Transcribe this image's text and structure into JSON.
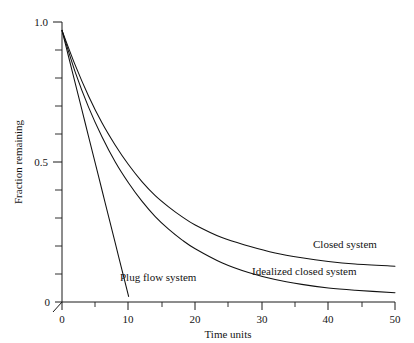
{
  "chart_data": {
    "type": "line",
    "title": "",
    "xlabel": "Time units",
    "ylabel": "Fraction remaining",
    "xlim": [
      0,
      50
    ],
    "ylim": [
      0,
      1.0
    ],
    "grid": false,
    "legend_position": "inline-right",
    "x_ticks_major": [
      0,
      10,
      20,
      30,
      40,
      50
    ],
    "x_tick_labels": [
      "0",
      "10",
      "20",
      "30",
      "40",
      "50"
    ],
    "x_ticks_minor": [
      5,
      15,
      25,
      35,
      45
    ],
    "y_ticks_major": [
      0,
      0.5,
      1.0
    ],
    "y_tick_labels": [
      "0",
      "0.5",
      "1.0"
    ],
    "y_ticks_minor": [
      0.1,
      0.2,
      0.3,
      0.4,
      0.6,
      0.7,
      0.8,
      0.9
    ],
    "series": [
      {
        "name": "Plug flow system",
        "label": "Plug flow system",
        "x": [
          0,
          1,
          2,
          3,
          4,
          5,
          6,
          7,
          8,
          9,
          10
        ],
        "values": [
          0.97,
          0.875,
          0.78,
          0.685,
          0.59,
          0.495,
          0.4,
          0.305,
          0.21,
          0.115,
          0.02
        ]
      },
      {
        "name": "Closed system",
        "label": "Closed system",
        "x": [
          0,
          2,
          4,
          6,
          8,
          10,
          12,
          14,
          16,
          18,
          20,
          24,
          28,
          32,
          36,
          40,
          44,
          50
        ],
        "values": [
          0.97,
          0.845,
          0.735,
          0.64,
          0.56,
          0.49,
          0.43,
          0.38,
          0.34,
          0.305,
          0.275,
          0.23,
          0.2,
          0.175,
          0.158,
          0.145,
          0.136,
          0.128
        ]
      },
      {
        "name": "Idealized closed system",
        "label": "Idealized closed system",
        "x": [
          0,
          2,
          4,
          6,
          8,
          10,
          12,
          14,
          16,
          18,
          20,
          24,
          28,
          32,
          36,
          40,
          44,
          50
        ],
        "values": [
          0.97,
          0.82,
          0.695,
          0.59,
          0.5,
          0.425,
          0.36,
          0.305,
          0.26,
          0.222,
          0.19,
          0.14,
          0.105,
          0.08,
          0.063,
          0.05,
          0.042,
          0.033
        ]
      }
    ],
    "annotations": [
      {
        "text": "Plug flow system",
        "x": 11.5,
        "y": 0.085
      },
      {
        "text": "Closed system",
        "x": 36.5,
        "y": 0.195
      },
      {
        "text": "Idealized closed system",
        "x": 27.5,
        "y": 0.105
      }
    ]
  }
}
